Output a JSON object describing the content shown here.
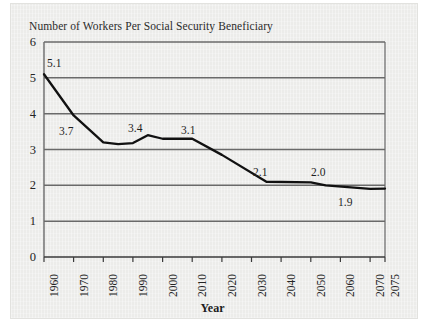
{
  "figure": {
    "background_color": "#ececea",
    "page_color": "#ffffff"
  },
  "chart_data": {
    "type": "line",
    "title": "Number of Workers Per Social Security Beneficiary",
    "xlabel": "Year",
    "ylabel": "",
    "grid": true,
    "legend": "none",
    "line_color": "#111111",
    "gridline_color": "#6a6a6a",
    "xlim": [
      1960,
      2075
    ],
    "ylim": [
      0,
      6
    ],
    "yticks": [
      "0",
      "1",
      "2",
      "3",
      "4",
      "5",
      "6"
    ],
    "ytick_values": [
      0,
      1,
      2,
      3,
      4,
      5,
      6
    ],
    "xticks": [
      "1960",
      "1970",
      "1980",
      "1990",
      "2000",
      "2010",
      "2020",
      "2030",
      "2040",
      "2050",
      "2060",
      "2070",
      "2075"
    ],
    "xtick_values": [
      1960,
      1970,
      1980,
      1990,
      2000,
      2010,
      2020,
      2030,
      2040,
      2050,
      2060,
      2070,
      2075
    ],
    "x": [
      1960,
      1970,
      1980,
      1985,
      1990,
      1995,
      2000,
      2010,
      2020,
      2035,
      2050,
      2055,
      2070,
      2075
    ],
    "y": [
      5.1,
      3.95,
      3.2,
      3.15,
      3.18,
      3.4,
      3.3,
      3.3,
      2.85,
      2.1,
      2.08,
      2.0,
      1.9,
      1.91
    ],
    "annotations": [
      {
        "label": "5.1",
        "x": 1960,
        "y": 5.1
      },
      {
        "label": "3.7",
        "x": 1970,
        "y": 3.95
      },
      {
        "label": "3.4",
        "x": 1995,
        "y": 3.4
      },
      {
        "label": "3.1",
        "x": 2010,
        "y": 3.3
      },
      {
        "label": "2.1",
        "x": 2035,
        "y": 2.1
      },
      {
        "label": "2.0",
        "x": 2053,
        "y": 2.0
      },
      {
        "label": "1.9",
        "x": 2068,
        "y": 1.9
      }
    ]
  }
}
